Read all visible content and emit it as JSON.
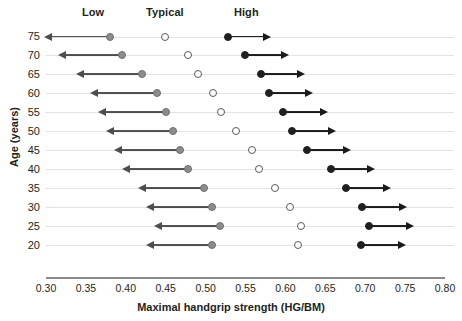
{
  "chart_data": {
    "type": "scatter",
    "title": "",
    "xlabel": "Maximal handgrip strength (HG/BM)",
    "ylabel": "Age (years)",
    "xlim": [
      0.3,
      0.8
    ],
    "ylim_categories": [
      75,
      70,
      65,
      60,
      55,
      50,
      45,
      40,
      35,
      30,
      25,
      20
    ],
    "xticks": [
      "0.30",
      "0.35",
      "0.40",
      "0.45",
      "0.50",
      "0.55",
      "0.60",
      "0.65",
      "0.70",
      "0.75",
      "0.80"
    ],
    "xtick_values": [
      0.3,
      0.35,
      0.4,
      0.45,
      0.5,
      0.55,
      0.6,
      0.65,
      0.7,
      0.75,
      0.8
    ],
    "yticks": [
      "75",
      "70",
      "65",
      "60",
      "55",
      "50",
      "45",
      "40",
      "35",
      "30",
      "25",
      "20"
    ],
    "grid": true,
    "legend_position": "top",
    "group_headers": [
      {
        "label": "Low",
        "x": 0.359
      },
      {
        "label": "Typical",
        "x": 0.449
      },
      {
        "label": "High",
        "x": 0.551
      }
    ],
    "series": [
      {
        "name": "Low",
        "marker": "filled-grey-circle",
        "color": "#8c8c8c",
        "arrow": "left",
        "values": [
          0.38,
          0.395,
          0.42,
          0.439,
          0.45,
          0.459,
          0.468,
          0.478,
          0.498,
          0.508,
          0.518,
          0.508
        ],
        "arrow_ends": [
          0.3,
          0.318,
          0.34,
          0.358,
          0.368,
          0.378,
          0.388,
          0.398,
          0.418,
          0.428,
          0.438,
          0.428
        ]
      },
      {
        "name": "Typical",
        "marker": "open-circle",
        "color": "#ffffff",
        "arrow": "none",
        "values": [
          0.449,
          0.478,
          0.49,
          0.509,
          0.519,
          0.538,
          0.558,
          0.567,
          0.587,
          0.606,
          0.62,
          0.616
        ],
        "arrow_ends": [
          null,
          null,
          null,
          null,
          null,
          null,
          null,
          null,
          null,
          null,
          null,
          null
        ]
      },
      {
        "name": "High",
        "marker": "filled-black-circle",
        "color": "#231f20",
        "arrow": "right",
        "values": [
          0.528,
          0.549,
          0.569,
          0.579,
          0.597,
          0.608,
          0.627,
          0.657,
          0.676,
          0.696,
          0.705,
          0.695
        ],
        "arrow_ends": [
          0.578,
          0.601,
          0.621,
          0.631,
          0.649,
          0.66,
          0.679,
          0.709,
          0.728,
          0.748,
          0.757,
          0.747
        ]
      }
    ],
    "rows": [
      {
        "age": "75",
        "low": 0.38,
        "low_end": 0.3,
        "typical": 0.449,
        "high": 0.528,
        "high_end": 0.578
      },
      {
        "age": "70",
        "low": 0.395,
        "low_end": 0.318,
        "typical": 0.478,
        "high": 0.549,
        "high_end": 0.601
      },
      {
        "age": "65",
        "low": 0.42,
        "low_end": 0.34,
        "typical": 0.49,
        "high": 0.569,
        "high_end": 0.621
      },
      {
        "age": "60",
        "low": 0.439,
        "low_end": 0.358,
        "typical": 0.509,
        "high": 0.579,
        "high_end": 0.631
      },
      {
        "age": "55",
        "low": 0.45,
        "low_end": 0.368,
        "typical": 0.519,
        "high": 0.597,
        "high_end": 0.649
      },
      {
        "age": "50",
        "low": 0.459,
        "low_end": 0.378,
        "typical": 0.538,
        "high": 0.608,
        "high_end": 0.66
      },
      {
        "age": "45",
        "low": 0.468,
        "low_end": 0.388,
        "typical": 0.558,
        "high": 0.627,
        "high_end": 0.679
      },
      {
        "age": "40",
        "low": 0.478,
        "low_end": 0.398,
        "typical": 0.567,
        "high": 0.657,
        "high_end": 0.709
      },
      {
        "age": "35",
        "low": 0.498,
        "low_end": 0.418,
        "typical": 0.587,
        "high": 0.676,
        "high_end": 0.728
      },
      {
        "age": "30",
        "low": 0.508,
        "low_end": 0.428,
        "typical": 0.606,
        "high": 0.696,
        "high_end": 0.748
      },
      {
        "age": "25",
        "low": 0.518,
        "low_end": 0.438,
        "typical": 0.62,
        "high": 0.705,
        "high_end": 0.757
      },
      {
        "age": "20",
        "low": 0.508,
        "low_end": 0.428,
        "typical": 0.616,
        "high": 0.695,
        "high_end": 0.747
      }
    ]
  },
  "colors": {
    "low": "#8c8c8c",
    "typical": "#ffffff",
    "high": "#231f20",
    "gridline": "#e3e3e3",
    "axis": "#8a8a8a",
    "text": "#231f20"
  }
}
